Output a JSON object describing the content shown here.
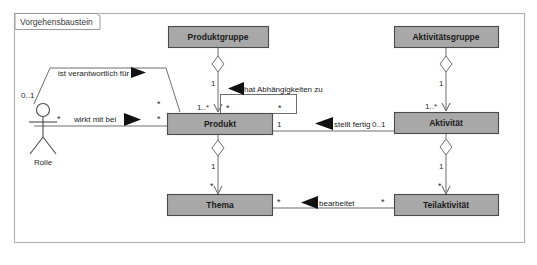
{
  "diagram": {
    "kind": "uml-class-diagram",
    "frame": {
      "tab_label": "Vorgehensbaustein",
      "border_color": "#b4b4b4",
      "background": "#ffffff"
    },
    "palette": {
      "class_fill": "#a8a8a8",
      "class_stroke": "#4a4a4a",
      "line": "#6d6d6d",
      "arrow_solid": "#111111",
      "text": "#1a1a1a"
    },
    "classes": [
      {
        "id": "produktgruppe",
        "label": "Produktgruppe",
        "x": 168,
        "y": 26,
        "w": 100,
        "h": 22
      },
      {
        "id": "aktivitaetsgruppe",
        "label": "Aktivitätsgruppe",
        "x": 394,
        "y": 26,
        "w": 104,
        "h": 22
      },
      {
        "id": "produkt",
        "label": "Produkt",
        "x": 167,
        "y": 113,
        "w": 105,
        "h": 22
      },
      {
        "id": "aktivitaet",
        "label": "Aktivität",
        "x": 394,
        "y": 112,
        "w": 104,
        "h": 22
      },
      {
        "id": "thema",
        "label": "Thema",
        "x": 167,
        "y": 194,
        "w": 105,
        "h": 22
      },
      {
        "id": "teilaktivitaet",
        "label": "Teilaktivität",
        "x": 394,
        "y": 194,
        "w": 104,
        "h": 22
      }
    ],
    "actor": {
      "id": "rolle",
      "label": "Rolle",
      "multiplicity": "0..1"
    },
    "associations": [
      {
        "id": "ist-verantwortlich-fuer",
        "name": "ist verantwortlich für",
        "from": "rolle",
        "to": "produkt",
        "direction": "right",
        "source_multiplicity": "0..1",
        "target_multiplicity": "*"
      },
      {
        "id": "wirkt-mit-bei",
        "name": "wirkt mit bei",
        "from": "rolle",
        "to": "produkt",
        "direction": "right",
        "source_multiplicity": "*",
        "target_multiplicity": "*"
      },
      {
        "id": "hat-abhaengigkeiten-zu",
        "name": "hat Abhängigkeiten zu",
        "from": "produkt",
        "to": "produkt",
        "direction": "left",
        "source_multiplicity": "*",
        "target_multiplicity": "*"
      },
      {
        "id": "stellt-fertig",
        "name": "stellt fertig",
        "from": "aktivitaet",
        "to": "produkt",
        "direction": "left",
        "source_multiplicity": "1",
        "target_multiplicity": "0..1"
      },
      {
        "id": "bearbeitet",
        "name": "bearbeitet",
        "from": "teilaktivitaet",
        "to": "thema",
        "direction": "left",
        "source_multiplicity": "*",
        "target_multiplicity": "*"
      }
    ],
    "aggregations": [
      {
        "id": "produktgruppe-produkt",
        "whole": "produktgruppe",
        "part": "produkt",
        "whole_multiplicity": "1",
        "part_multiplicity": "1..*"
      },
      {
        "id": "produkt-thema",
        "whole": "produkt",
        "part": "thema",
        "whole_multiplicity": "1",
        "part_multiplicity": "*"
      },
      {
        "id": "aktivitaetsgruppe-aktivitaet",
        "whole": "aktivitaetsgruppe",
        "part": "aktivitaet",
        "whole_multiplicity": "1",
        "part_multiplicity": "1..*"
      },
      {
        "id": "aktivitaet-teilaktivitaet",
        "whole": "aktivitaet",
        "part": "teilaktivitaet",
        "whole_multiplicity": "1",
        "part_multiplicity": "*"
      }
    ]
  }
}
